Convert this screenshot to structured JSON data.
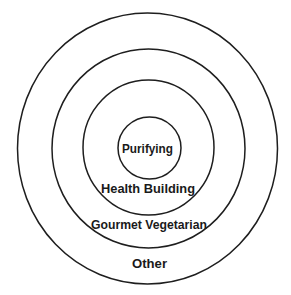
{
  "diagram": {
    "type": "concentric-circles",
    "stroke_color": "#1e1e1e",
    "text_color": "#1a1a1a",
    "background": "#ffffff",
    "rings": [
      {
        "label": "Other",
        "level": 4
      },
      {
        "label": "Gourmet Vegetarian",
        "level": 3
      },
      {
        "label": "Health Building",
        "level": 2
      },
      {
        "label": "Purifying",
        "level": 1
      }
    ]
  }
}
